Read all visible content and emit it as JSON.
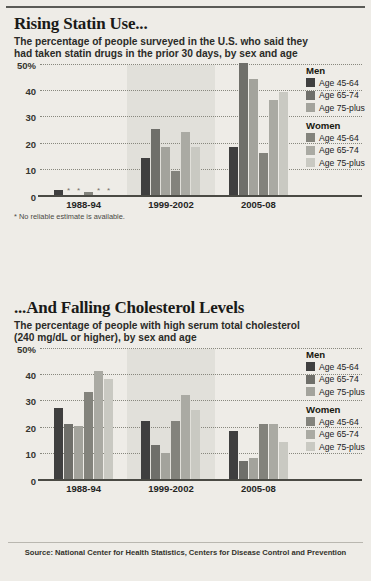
{
  "page": {
    "background_color": "#eeece7",
    "source_note": "Source: National Center for Health Statistics, Centers for Disease Control and Prevention"
  },
  "colors": {
    "men_45_64": "#3f3f3f",
    "men_65_74": "#6f6f6a",
    "men_75_plus": "#a3a39c",
    "women_45_64": "#83837c",
    "women_65_74": "#aaaaa3",
    "women_75_plus": "#c9c9c2",
    "axis": "#4a4a44",
    "grid": "#88887e"
  },
  "legend": {
    "groups": [
      {
        "heading": "Men",
        "items": [
          {
            "label": "Age 45-64",
            "color": "#3f3f3f"
          },
          {
            "label": "Age 65-74",
            "color": "#6f6f6a"
          },
          {
            "label": "Age 75-plus",
            "color": "#a3a39c"
          }
        ]
      },
      {
        "heading": "Women",
        "items": [
          {
            "label": "Age 45-64",
            "color": "#83837c"
          },
          {
            "label": "Age 65-74",
            "color": "#aaaaa3"
          },
          {
            "label": "Age 75-plus",
            "color": "#c9c9c2"
          }
        ]
      }
    ]
  },
  "chart_data": [
    {
      "id": "statin-use",
      "type": "bar",
      "title": "Rising Statin Use...",
      "subtitle": "The percentage of people surveyed in the U.S. who said they had taken statin drugs in the prior 30 days, by sex and age",
      "xlabel": "",
      "ylabel": "",
      "ylim": [
        0,
        50
      ],
      "yticks": [
        0,
        10,
        20,
        30,
        40,
        50
      ],
      "ytick_labels": [
        "0",
        "10",
        "20",
        "30",
        "40",
        "50%"
      ],
      "grid": true,
      "legend_position": "right",
      "footnote": "* No reliable estimate is available.",
      "no_data_marker": "*",
      "categories": [
        "1988-94",
        "1999-2002",
        "2005-08"
      ],
      "series": [
        {
          "name": "Men Age 45-64",
          "color": "#3f3f3f",
          "values": [
            2,
            14,
            18
          ]
        },
        {
          "name": "Men Age 65-74",
          "color": "#6f6f6a",
          "values": [
            null,
            25,
            50
          ]
        },
        {
          "name": "Men Age 75-plus",
          "color": "#a3a39c",
          "values": [
            null,
            18,
            44
          ]
        },
        {
          "name": "Women Age 45-64",
          "color": "#83837c",
          "values": [
            1,
            9,
            16
          ]
        },
        {
          "name": "Women Age 65-74",
          "color": "#aaaaa3",
          "values": [
            null,
            24,
            36
          ]
        },
        {
          "name": "Women Age 75-plus",
          "color": "#c9c9c2",
          "values": [
            null,
            18,
            39
          ]
        }
      ]
    },
    {
      "id": "cholesterol-levels",
      "type": "bar",
      "title": "...And Falling Cholesterol Levels",
      "subtitle": "The percentage of people with high serum total cholesterol (240 mg/dL or higher), by sex and age",
      "xlabel": "",
      "ylabel": "",
      "ylim": [
        0,
        50
      ],
      "yticks": [
        0,
        10,
        20,
        30,
        40,
        50
      ],
      "ytick_labels": [
        "0",
        "10",
        "20",
        "30",
        "40",
        "50%"
      ],
      "grid": true,
      "legend_position": "right",
      "categories": [
        "1988-94",
        "1999-2002",
        "2005-08"
      ],
      "series": [
        {
          "name": "Men Age 45-64",
          "color": "#3f3f3f",
          "values": [
            27,
            22,
            18
          ]
        },
        {
          "name": "Men Age 65-74",
          "color": "#6f6f6a",
          "values": [
            21,
            13,
            7
          ]
        },
        {
          "name": "Men Age 75-plus",
          "color": "#a3a39c",
          "values": [
            20,
            10,
            8
          ]
        },
        {
          "name": "Women Age 45-64",
          "color": "#83837c",
          "values": [
            33,
            22,
            21
          ]
        },
        {
          "name": "Women Age 65-74",
          "color": "#aaaaa3",
          "values": [
            41,
            32,
            21
          ]
        },
        {
          "name": "Women Age 75-plus",
          "color": "#c9c9c2",
          "values": [
            38,
            26,
            14
          ]
        }
      ]
    }
  ]
}
